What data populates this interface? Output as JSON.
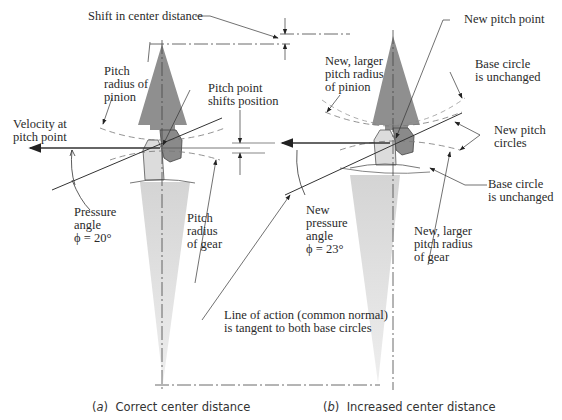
{
  "figure": {
    "panel_a": {
      "caption_letter": "a",
      "caption_text": "Correct center distance",
      "labels": {
        "shift_center_distance": "Shift in center distance",
        "pitch_radius_pinion": "Pitch\nradius of\npinion",
        "pitch_point_shifts": "Pitch point\nshifts position",
        "velocity_pitch_point": "Velocity at\npitch point",
        "pressure_angle": "Pressure\nangle\nϕ = 20°",
        "pitch_radius_gear": "Pitch\nradius\nof gear"
      }
    },
    "panel_b": {
      "caption_letter": "b",
      "caption_text": "Increased center distance",
      "labels": {
        "new_pitch_point": "New pitch point",
        "new_pitch_radius_pinion": "New, larger\npitch radius\nof pinion",
        "base_circle_top": "Base circle\nis unchanged",
        "new_pitch_circles": "New pitch\ncircles",
        "base_circle_bottom": "Base circle\nis unchanged",
        "new_pressure_angle": "New\npressure\nangle\nϕ = 23°",
        "new_pitch_radius_gear": "New, larger\npitch radius\nof gear"
      }
    },
    "shared": {
      "line_of_action": "Line of action (common normal)\nis tangent to both base circles"
    },
    "colors": {
      "pinion_fill": "#8c8c8c",
      "gear_fill": "#d9d9d9",
      "line": "#333333",
      "text": "#2a2a2a"
    }
  }
}
